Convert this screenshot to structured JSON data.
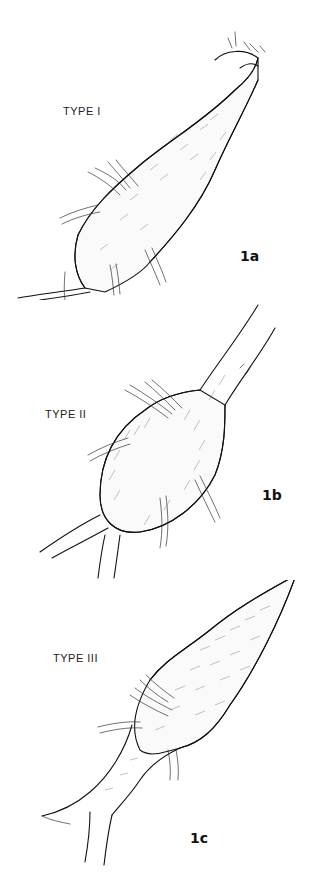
{
  "figures": [
    {
      "id": "1a",
      "type_label": "TYPE I",
      "figure_label": "1a"
    },
    {
      "id": "1b",
      "type_label": "TYPE II",
      "figure_label": "1b"
    },
    {
      "id": "1c",
      "type_label": "TYPE III",
      "figure_label": "1c"
    }
  ],
  "colors": {
    "ink": "#111111",
    "background": "#ffffff"
  }
}
